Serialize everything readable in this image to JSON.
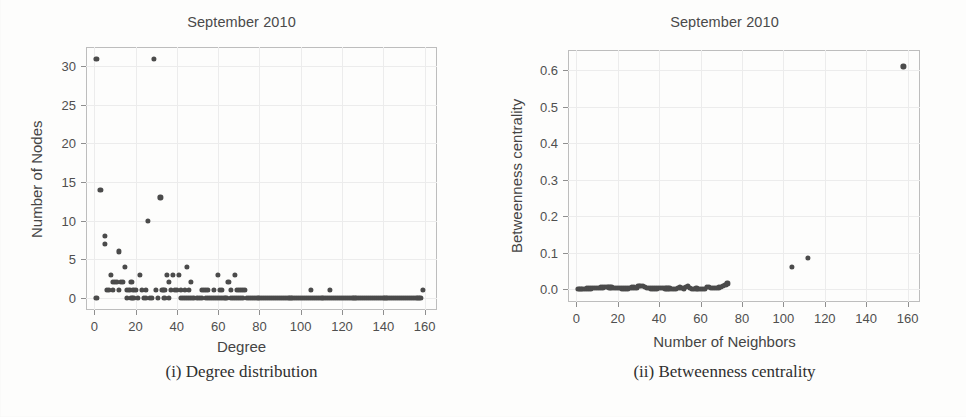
{
  "figure": {
    "background_color": "#fdfdfc",
    "marker_color": "#4b4b4b",
    "frame_color": "#bdbdbd",
    "grid_color": "#ececec"
  },
  "panels": [
    {
      "id": "degree-distribution",
      "title": "September 2010",
      "caption": "(i) Degree distribution",
      "chart_data": {
        "type": "scatter",
        "title": "September 2010",
        "xlabel": "Degree",
        "ylabel": "Number of Nodes",
        "xlim": [
          -4,
          166
        ],
        "ylim": [
          -1.6,
          32.5
        ],
        "xticks": [
          0,
          20,
          40,
          60,
          80,
          100,
          120,
          140,
          160
        ],
        "xticklabels": [
          "0",
          "20",
          "40",
          "60",
          "80",
          "100",
          "120",
          "140",
          "160"
        ],
        "yticks": [
          0,
          5,
          10,
          15,
          20,
          25,
          30
        ],
        "yticklabels": [
          "0",
          "5",
          "10",
          "15",
          "20",
          "25",
          "30"
        ],
        "grid": true,
        "legend": "none",
        "points": [
          [
            1,
            31
          ],
          [
            29,
            31
          ],
          [
            3,
            14
          ],
          [
            32,
            13
          ],
          [
            26,
            10
          ],
          [
            5,
            8
          ],
          [
            5,
            7
          ],
          [
            12,
            6
          ],
          [
            15,
            4
          ],
          [
            45,
            4
          ],
          [
            8,
            3
          ],
          [
            22,
            3
          ],
          [
            35,
            3
          ],
          [
            38,
            3
          ],
          [
            41,
            3
          ],
          [
            60,
            3
          ],
          [
            68,
            3
          ],
          [
            9,
            2
          ],
          [
            10,
            2
          ],
          [
            11,
            2
          ],
          [
            13,
            2
          ],
          [
            14,
            2
          ],
          [
            18,
            2
          ],
          [
            36,
            2
          ],
          [
            47,
            2
          ],
          [
            65,
            2
          ],
          [
            6,
            1
          ],
          [
            7,
            1
          ],
          [
            9,
            1
          ],
          [
            12,
            1
          ],
          [
            16,
            1
          ],
          [
            17,
            1
          ],
          [
            19,
            1
          ],
          [
            20,
            1
          ],
          [
            23,
            1
          ],
          [
            25,
            1
          ],
          [
            30,
            1
          ],
          [
            33,
            1
          ],
          [
            34,
            1
          ],
          [
            37,
            1
          ],
          [
            39,
            1
          ],
          [
            40,
            1
          ],
          [
            42,
            1
          ],
          [
            44,
            1
          ],
          [
            46,
            1
          ],
          [
            52,
            1
          ],
          [
            53,
            1
          ],
          [
            54,
            1
          ],
          [
            55,
            1
          ],
          [
            58,
            1
          ],
          [
            61,
            1
          ],
          [
            62,
            1
          ],
          [
            66,
            1
          ],
          [
            69,
            1
          ],
          [
            70,
            1
          ],
          [
            71,
            1
          ],
          [
            72,
            1
          ],
          [
            73,
            1
          ],
          [
            105,
            1
          ],
          [
            114,
            1
          ],
          [
            159,
            1
          ],
          [
            1,
            0
          ],
          [
            16,
            0
          ],
          [
            18,
            0
          ],
          [
            19,
            0
          ],
          [
            21,
            0
          ],
          [
            24,
            0
          ],
          [
            25,
            0
          ],
          [
            27,
            0
          ],
          [
            28,
            0
          ],
          [
            31,
            0
          ],
          [
            34,
            0
          ],
          [
            36,
            0
          ],
          [
            42,
            0
          ],
          [
            43,
            0
          ],
          [
            44,
            0
          ],
          [
            45,
            0
          ],
          [
            46,
            0
          ],
          [
            47,
            0
          ],
          [
            48,
            0
          ],
          [
            50,
            0
          ],
          [
            51,
            0
          ],
          [
            52,
            0
          ],
          [
            54,
            0
          ],
          [
            55,
            0
          ],
          [
            56,
            0
          ],
          [
            57,
            0
          ],
          [
            58,
            0
          ],
          [
            59,
            0
          ],
          [
            60,
            0
          ],
          [
            61,
            0
          ],
          [
            62,
            0
          ],
          [
            63,
            0
          ],
          [
            64,
            0
          ],
          [
            66,
            0
          ],
          [
            67,
            0
          ],
          [
            68,
            0
          ],
          [
            69,
            0
          ],
          [
            70,
            0
          ],
          [
            71,
            0
          ],
          [
            72,
            0
          ],
          [
            74,
            0
          ],
          [
            75,
            0
          ],
          [
            76,
            0
          ],
          [
            77,
            0
          ],
          [
            78,
            0
          ],
          [
            79,
            0
          ],
          [
            80,
            0
          ],
          [
            81,
            0
          ],
          [
            82,
            0
          ],
          [
            83,
            0
          ],
          [
            84,
            0
          ],
          [
            85,
            0
          ],
          [
            86,
            0
          ],
          [
            87,
            0
          ],
          [
            88,
            0
          ],
          [
            89,
            0
          ],
          [
            90,
            0
          ],
          [
            91,
            0
          ],
          [
            92,
            0
          ],
          [
            93,
            0
          ],
          [
            94,
            0
          ],
          [
            95,
            0
          ],
          [
            96,
            0
          ],
          [
            97,
            0
          ],
          [
            98,
            0
          ],
          [
            99,
            0
          ],
          [
            100,
            0
          ],
          [
            101,
            0
          ],
          [
            102,
            0
          ],
          [
            103,
            0
          ],
          [
            104,
            0
          ],
          [
            105,
            0
          ],
          [
            106,
            0
          ],
          [
            107,
            0
          ],
          [
            108,
            0
          ],
          [
            109,
            0
          ],
          [
            110,
            0
          ],
          [
            111,
            0
          ],
          [
            112,
            0
          ],
          [
            113,
            0
          ],
          [
            114,
            0
          ],
          [
            115,
            0
          ],
          [
            116,
            0
          ],
          [
            117,
            0
          ],
          [
            118,
            0
          ],
          [
            119,
            0
          ],
          [
            120,
            0
          ],
          [
            121,
            0
          ],
          [
            122,
            0
          ],
          [
            123,
            0
          ],
          [
            124,
            0
          ],
          [
            125,
            0
          ],
          [
            126,
            0
          ],
          [
            127,
            0
          ],
          [
            128,
            0
          ],
          [
            129,
            0
          ],
          [
            130,
            0
          ],
          [
            131,
            0
          ],
          [
            132,
            0
          ],
          [
            133,
            0
          ],
          [
            134,
            0
          ],
          [
            135,
            0
          ],
          [
            136,
            0
          ],
          [
            137,
            0
          ],
          [
            138,
            0
          ],
          [
            139,
            0
          ],
          [
            140,
            0
          ],
          [
            141,
            0
          ],
          [
            142,
            0
          ],
          [
            143,
            0
          ],
          [
            144,
            0
          ],
          [
            145,
            0
          ],
          [
            146,
            0
          ],
          [
            147,
            0
          ],
          [
            148,
            0
          ],
          [
            149,
            0
          ],
          [
            150,
            0
          ],
          [
            151,
            0
          ],
          [
            152,
            0
          ],
          [
            153,
            0
          ],
          [
            154,
            0
          ],
          [
            155,
            0
          ],
          [
            156,
            0
          ],
          [
            157,
            0
          ],
          [
            158,
            0
          ]
        ]
      }
    },
    {
      "id": "betweenness-centrality",
      "title": "September 2010",
      "caption": "(ii) Betweenness centrality",
      "chart_data": {
        "type": "scatter",
        "title": "September 2010",
        "xlabel": "Number of Neighbors",
        "ylabel": "Betweenness centrality",
        "xlim": [
          -4,
          166
        ],
        "ylim": [
          -0.035,
          0.655
        ],
        "xticks": [
          0,
          20,
          40,
          60,
          80,
          100,
          120,
          140,
          160
        ],
        "xticklabels": [
          "0",
          "20",
          "40",
          "60",
          "80",
          "100",
          "120",
          "140",
          "160"
        ],
        "yticks": [
          0.0,
          0.1,
          0.2,
          0.3,
          0.4,
          0.5,
          0.6
        ],
        "yticklabels": [
          "0.0",
          "0.1",
          "0.2",
          "0.3",
          "0.4",
          "0.5",
          "0.6"
        ],
        "grid": true,
        "legend": "none",
        "points": [
          [
            158,
            0.61
          ],
          [
            112,
            0.086
          ],
          [
            104,
            0.062
          ],
          [
            1,
            0.0
          ],
          [
            2,
            0.0
          ],
          [
            3,
            0.001
          ],
          [
            4,
            0.001
          ],
          [
            5,
            0.002
          ],
          [
            6,
            0.002
          ],
          [
            7,
            0.002
          ],
          [
            8,
            0.003
          ],
          [
            9,
            0.003
          ],
          [
            10,
            0.004
          ],
          [
            11,
            0.004
          ],
          [
            12,
            0.005
          ],
          [
            13,
            0.005
          ],
          [
            14,
            0.006
          ],
          [
            15,
            0.006
          ],
          [
            16,
            0.005
          ],
          [
            17,
            0.005
          ],
          [
            18,
            0.004
          ],
          [
            19,
            0.004
          ],
          [
            20,
            0.003
          ],
          [
            21,
            0.003
          ],
          [
            22,
            0.002
          ],
          [
            23,
            0.002
          ],
          [
            24,
            0.002
          ],
          [
            25,
            0.002
          ],
          [
            26,
            0.004
          ],
          [
            27,
            0.005
          ],
          [
            28,
            0.005
          ],
          [
            29,
            0.004
          ],
          [
            30,
            0.009
          ],
          [
            31,
            0.01
          ],
          [
            32,
            0.008
          ],
          [
            33,
            0.006
          ],
          [
            34,
            0.004
          ],
          [
            35,
            0.003
          ],
          [
            36,
            0.002
          ],
          [
            37,
            0.002
          ],
          [
            38,
            0.002
          ],
          [
            39,
            0.002
          ],
          [
            40,
            0.003
          ],
          [
            41,
            0.003
          ],
          [
            42,
            0.003
          ],
          [
            43,
            0.002
          ],
          [
            44,
            0.002
          ],
          [
            45,
            0.002
          ],
          [
            46,
            0.001
          ],
          [
            47,
            0.0
          ],
          [
            48,
            0.0
          ],
          [
            49,
            0.003
          ],
          [
            50,
            0.005
          ],
          [
            51,
            0.003
          ],
          [
            52,
            0.002
          ],
          [
            53,
            0.007
          ],
          [
            54,
            0.008
          ],
          [
            55,
            0.004
          ],
          [
            56,
            0.001
          ],
          [
            57,
            0.001
          ],
          [
            58,
            0.002
          ],
          [
            59,
            0.001
          ],
          [
            60,
            0.0
          ],
          [
            61,
            0.0
          ],
          [
            62,
            0.001
          ],
          [
            63,
            0.006
          ],
          [
            64,
            0.006
          ],
          [
            65,
            0.004
          ],
          [
            66,
            0.003
          ],
          [
            67,
            0.003
          ],
          [
            68,
            0.004
          ],
          [
            69,
            0.005
          ],
          [
            70,
            0.007
          ],
          [
            71,
            0.009
          ],
          [
            72,
            0.012
          ],
          [
            73,
            0.016
          ]
        ]
      }
    }
  ]
}
